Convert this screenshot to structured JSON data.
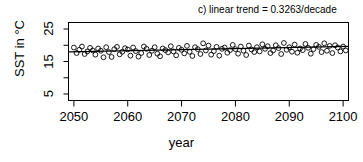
{
  "chart_data": {
    "type": "scatter",
    "title": "c) linear trend = 0.3263/decade",
    "xlabel": "year",
    "ylabel": "SST in °C",
    "xlim": [
      2049,
      2101
    ],
    "ylim": [
      3,
      27
    ],
    "xticks": [
      2050,
      2060,
      2070,
      2080,
      2090,
      2100
    ],
    "yticks": [
      5,
      15,
      25
    ],
    "yticks_minor": [
      10,
      20
    ],
    "grid": false,
    "legend": null,
    "marker": "open-circle",
    "point_color": "#000000",
    "line_color": "#000000",
    "trend_per_decade": 0.3263,
    "trendline": {
      "x": [
        2049,
        2101
      ],
      "y": [
        17.95,
        19.65
      ]
    },
    "series": [
      {
        "name": "SST",
        "x": [
          2050,
          2050.5,
          2051,
          2051.5,
          2052,
          2052.5,
          2053,
          2053.5,
          2054,
          2054.5,
          2055,
          2055.5,
          2056,
          2056.5,
          2057,
          2057.5,
          2058,
          2058.5,
          2059,
          2059.5,
          2060,
          2060.5,
          2061,
          2061.5,
          2062,
          2062.5,
          2063,
          2063.5,
          2064,
          2064.5,
          2065,
          2065.5,
          2066,
          2066.5,
          2067,
          2067.5,
          2068,
          2068.5,
          2069,
          2069.5,
          2070,
          2070.5,
          2071,
          2071.5,
          2072,
          2072.5,
          2073,
          2073.5,
          2074,
          2074.5,
          2075,
          2075.5,
          2076,
          2076.5,
          2077,
          2077.5,
          2078,
          2078.5,
          2079,
          2079.5,
          2080,
          2080.5,
          2081,
          2081.5,
          2082,
          2082.5,
          2083,
          2083.5,
          2084,
          2084.5,
          2085,
          2085.5,
          2086,
          2086.5,
          2087,
          2087.5,
          2088,
          2088.5,
          2089,
          2089.5,
          2090,
          2090.5,
          2091,
          2091.5,
          2092,
          2092.5,
          2093,
          2093.5,
          2094,
          2094.5,
          2095,
          2095.5,
          2096,
          2096.5,
          2097,
          2097.5,
          2098,
          2098.5,
          2099,
          2099.5,
          2100,
          2100.5
        ],
        "y": [
          19.3,
          17.6,
          18.6,
          19.6,
          17.3,
          18.1,
          19.2,
          18.4,
          17.1,
          19.0,
          18.3,
          16.3,
          19.4,
          17.9,
          16.4,
          18.8,
          19.5,
          17.2,
          18.0,
          19.1,
          18.7,
          16.8,
          19.3,
          18.2,
          16.5,
          17.6,
          19.6,
          18.9,
          17.0,
          18.3,
          19.4,
          17.4,
          16.6,
          19.0,
          18.5,
          17.8,
          19.7,
          18.1,
          16.9,
          19.2,
          18.6,
          17.5,
          19.8,
          18.0,
          16.7,
          19.4,
          18.8,
          17.3,
          20.6,
          18.4,
          19.9,
          17.1,
          18.2,
          19.5,
          16.8,
          18.9,
          19.3,
          17.7,
          18.5,
          20.1,
          18.8,
          17.4,
          19.6,
          18.3,
          17.0,
          19.9,
          18.7,
          17.9,
          19.4,
          18.1,
          20.3,
          18.9,
          19.7,
          17.6,
          18.4,
          20.0,
          19.1,
          17.3,
          20.7,
          18.6,
          19.4,
          18.0,
          20.2,
          17.7,
          19.0,
          18.5,
          20.4,
          19.2,
          17.4,
          18.8,
          20.1,
          19.5,
          17.9,
          20.6,
          18.3,
          19.8,
          17.6,
          20.0,
          19.3,
          18.1,
          19.6,
          18.4
        ]
      }
    ]
  },
  "axes": {
    "tick_labels_x": [
      "2050",
      "2060",
      "2070",
      "2080",
      "2090",
      "2100"
    ],
    "tick_labels_y": [
      "5",
      "15",
      "25"
    ]
  }
}
